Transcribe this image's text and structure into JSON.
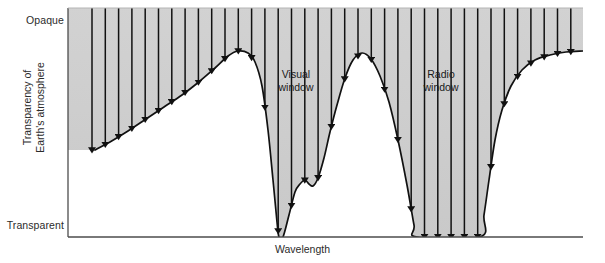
{
  "figure": {
    "title_visible": false,
    "axes": {
      "y_title": "Transparency of\nEarth's atmosphere",
      "y_title_line1": "Transparency of",
      "y_title_line2": "Earth's atmosphere",
      "y_top_label": "Opaque",
      "y_bottom_label": "Transparent",
      "x_title": "Wavelength"
    },
    "annotations": [
      {
        "id": "visual-window",
        "line1": "Visual",
        "line2": "window"
      },
      {
        "id": "radio-window",
        "line1": "Radio",
        "line2": "window"
      }
    ],
    "colors": {
      "opaque_fill_top": "#d2d2d2",
      "opaque_fill_bottom": "#c9c9c9",
      "transparent_fill": "#ffffff",
      "curve": "#111111",
      "arrow": "#111111",
      "axis": "#4d4d4d",
      "text": "#2b2b2b",
      "page_background": "#ffffff"
    }
  },
  "chart_data": {
    "type": "line",
    "title": "",
    "xlabel": "Wavelength",
    "ylabel": "Transparency of Earth's atmosphere",
    "grid": false,
    "legend": false,
    "y_axis_category_labels": [
      "Transparent",
      "Opaque"
    ],
    "y_axis_direction": "Opaque at top, Transparent at bottom",
    "x_tick_labels": [],
    "y_tick_labels": [
      "Opaque",
      "Transparent"
    ],
    "series": [
      {
        "name": "Atmospheric opacity boundary",
        "description": "Curve separating the opaque (shaded, above) region from the transparent (white, below) region. Dips to the Transparent baseline mark atmospheric windows.",
        "points": [
          [
            95,
            150
          ],
          [
            110,
            142
          ],
          [
            128,
            131
          ],
          [
            146,
            119
          ],
          [
            164,
            107
          ],
          [
            182,
            95
          ],
          [
            200,
            81
          ],
          [
            215,
            68
          ],
          [
            228,
            56
          ],
          [
            238,
            51
          ],
          [
            248,
            53
          ],
          [
            255,
            62
          ],
          [
            262,
            86
          ],
          [
            268,
            130
          ],
          [
            273,
            180
          ],
          [
            277,
            222
          ],
          [
            279,
            237
          ],
          [
            283,
            237
          ],
          [
            289,
            215
          ],
          [
            295,
            192
          ],
          [
            300,
            184
          ],
          [
            305,
            180
          ],
          [
            309,
            184
          ],
          [
            313,
            186
          ],
          [
            318,
            178
          ],
          [
            324,
            158
          ],
          [
            330,
            132
          ],
          [
            337,
            105
          ],
          [
            345,
            78
          ],
          [
            353,
            60
          ],
          [
            362,
            53
          ],
          [
            371,
            59
          ],
          [
            380,
            76
          ],
          [
            389,
            102
          ],
          [
            398,
            140
          ],
          [
            407,
            185
          ],
          [
            414,
            225
          ],
          [
            417,
            237
          ],
          [
            480,
            237
          ],
          [
            484,
            215
          ],
          [
            489,
            180
          ],
          [
            495,
            140
          ],
          [
            502,
            110
          ],
          [
            511,
            86
          ],
          [
            522,
            70
          ],
          [
            535,
            60
          ],
          [
            550,
            55
          ],
          [
            566,
            52
          ],
          [
            583,
            51
          ]
        ]
      }
    ],
    "windows": [
      {
        "name": "Visual window",
        "label_lines": [
          "Visual",
          "window"
        ],
        "x_range": [
          275,
          285
        ],
        "note": "Narrow deep notch reaching the Transparent baseline"
      },
      {
        "name": "Radio window",
        "label_lines": [
          "Radio",
          "window"
        ],
        "x_range": [
          417,
          480
        ],
        "note": "Broad flat region at the Transparent baseline"
      }
    ],
    "arrows": {
      "name": "Incoming radiation arrows",
      "direction": "downward",
      "count": 37,
      "x_start": 92,
      "x_spacing": 13.3,
      "note": "Vertical arrows descend from the top of the plot and terminate where they meet the opacity curve or the baseline; arrows over the windows reach the bottom axis."
    },
    "plot_box": {
      "left": 68,
      "top": 8,
      "right": 583,
      "bottom": 237
    }
  }
}
